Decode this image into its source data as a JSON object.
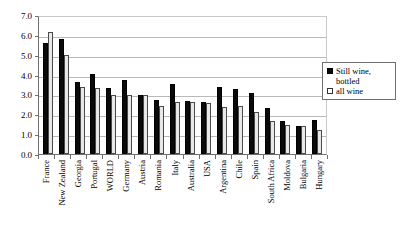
{
  "chart_data": {
    "type": "bar",
    "title": "",
    "xlabel": "",
    "ylabel": "",
    "ylim": [
      0.0,
      7.0
    ],
    "ytick_step": 1.0,
    "grid": true,
    "legend_position": "right",
    "ytick_labels": [
      "7.0",
      "6.0",
      "5.0",
      "4.0",
      "3.0",
      "2.0",
      "1.0",
      "0.0"
    ],
    "ytick_values": [
      7.0,
      6.0,
      5.0,
      4.0,
      3.0,
      2.0,
      1.0,
      0.0
    ],
    "categories": [
      "France",
      "New Zealand",
      "Georgia",
      "Portugal",
      "WORLD",
      "Germany",
      "Austria",
      "Romania",
      "Italy",
      "Australia",
      "USA",
      "Argentina",
      "Chile",
      "Spain",
      "South Africa",
      "Moldova",
      "Bulgaria",
      "Hungary"
    ],
    "series": [
      {
        "name": "Still wine, bottled",
        "color": "#0a0a0a",
        "values": [
          5.6,
          5.8,
          3.65,
          4.05,
          3.3,
          3.75,
          2.95,
          2.7,
          3.55,
          2.65,
          2.6,
          3.4,
          3.25,
          3.05,
          2.3,
          1.65,
          1.4,
          1.7
        ]
      },
      {
        "name": "all wine",
        "color": "#e8e8e8",
        "values": [
          6.15,
          5.0,
          3.35,
          3.3,
          2.95,
          2.95,
          2.95,
          2.4,
          2.6,
          2.6,
          2.55,
          2.35,
          2.4,
          2.1,
          1.65,
          1.45,
          1.4,
          1.2
        ]
      }
    ]
  },
  "legend": {
    "items": [
      {
        "label": "Still wine, bottled",
        "swatch": "filled-square"
      },
      {
        "label": "all wine",
        "swatch": "open-square"
      }
    ]
  }
}
